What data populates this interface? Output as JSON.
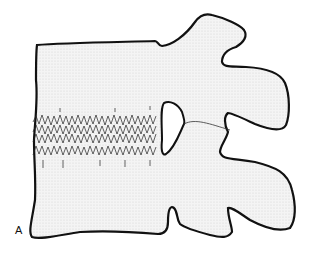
{
  "figure": {
    "panel_label": "A",
    "fill_color": "#f1f1f1",
    "stroke_color": "#111111",
    "features": [
      "vertebral-body",
      "disc-degeneration-band",
      "pedicle-foramen",
      "facet-joint",
      "superior-articular-process",
      "inferior-articular-process",
      "spinous-process"
    ]
  }
}
